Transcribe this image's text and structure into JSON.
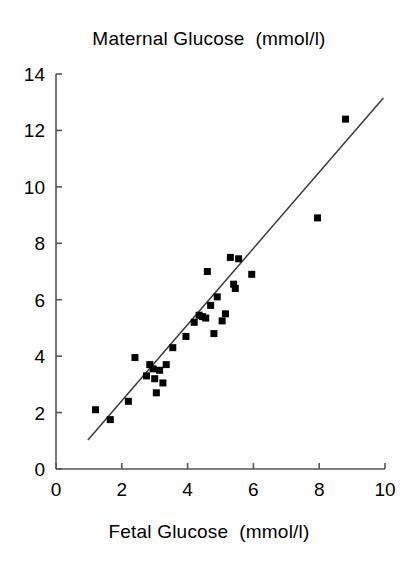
{
  "chart_data": {
    "type": "scatter",
    "title": "Maternal Glucose  (mmol/l)",
    "xlabel": "Fetal Glucose  (mmol/l)",
    "ylabel": "Maternal Glucose  (mmol/l)",
    "xlim": [
      0,
      10
    ],
    "ylim": [
      0,
      14
    ],
    "xticks": [
      0,
      2,
      4,
      6,
      8,
      10
    ],
    "yticks": [
      0,
      2,
      4,
      6,
      8,
      10,
      12,
      14
    ],
    "xtick_labels": [
      "0",
      "2",
      "4",
      "6",
      "8",
      "10"
    ],
    "ytick_labels": [
      "0",
      "2",
      "4",
      "6",
      "8",
      "10",
      "12",
      "14"
    ],
    "grid": false,
    "legend": null,
    "marker": "square",
    "marker_color": "#000000",
    "marker_size_px": 7,
    "axis_color": "#555555",
    "series": [
      {
        "name": "Fetal vs Maternal Glucose",
        "points": [
          [
            1.2,
            2.1
          ],
          [
            1.65,
            1.75
          ],
          [
            2.2,
            2.4
          ],
          [
            2.4,
            3.95
          ],
          [
            2.75,
            3.3
          ],
          [
            2.85,
            3.7
          ],
          [
            2.95,
            3.55
          ],
          [
            3.0,
            3.2
          ],
          [
            3.05,
            2.7
          ],
          [
            3.15,
            3.5
          ],
          [
            3.25,
            3.05
          ],
          [
            3.35,
            3.7
          ],
          [
            3.55,
            4.3
          ],
          [
            3.95,
            4.7
          ],
          [
            4.2,
            5.2
          ],
          [
            4.35,
            5.45
          ],
          [
            4.45,
            5.4
          ],
          [
            4.55,
            5.35
          ],
          [
            4.6,
            7.0
          ],
          [
            4.7,
            5.8
          ],
          [
            4.8,
            4.8
          ],
          [
            4.9,
            6.1
          ],
          [
            5.05,
            5.25
          ],
          [
            5.15,
            5.5
          ],
          [
            5.3,
            7.5
          ],
          [
            5.4,
            6.55
          ],
          [
            5.45,
            6.4
          ],
          [
            5.55,
            7.45
          ],
          [
            5.95,
            6.9
          ],
          [
            7.95,
            8.9
          ],
          [
            8.8,
            12.4
          ]
        ]
      }
    ],
    "trendline": {
      "type": "linear-fit",
      "x_start": 0.97,
      "y_start": 1.03,
      "x_end": 9.95,
      "y_end": 13.15
    }
  },
  "axes_geometry": {
    "x0_px": 56,
    "x10_px": 385,
    "y0_px": 469,
    "y14_px": 74,
    "tick_len_px": 6
  }
}
